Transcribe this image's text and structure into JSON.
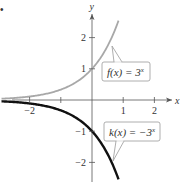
{
  "marker": "•",
  "chart_data": {
    "type": "line",
    "title": "",
    "xlabel": "x",
    "ylabel": "y",
    "xlim": [
      -2.9,
      2.6
    ],
    "ylim": [
      -2.6,
      2.8
    ],
    "x_ticks": [
      -2,
      -1,
      1,
      2
    ],
    "x_tick_labels": [
      "−2",
      "",
      "1",
      "2"
    ],
    "y_ticks": [
      -2,
      -1,
      1,
      2
    ],
    "y_tick_labels": [
      "−2",
      "−1",
      "1",
      "2"
    ],
    "grid": false,
    "series": [
      {
        "name": "f(x) = 3^x",
        "label_text": "f(x) = 3",
        "label_exp": "x",
        "color": "#a8a8a8",
        "x": [
          -2.9,
          -2.5,
          -2.0,
          -1.5,
          -1.0,
          -0.5,
          0.0,
          0.25,
          0.5,
          0.75,
          0.85
        ],
        "y": [
          0.041,
          0.064,
          0.111,
          0.192,
          0.333,
          0.577,
          1.0,
          1.316,
          1.732,
          2.28,
          2.544
        ]
      },
      {
        "name": "k(x) = -3^x",
        "label_text": "k(x) = −3",
        "label_exp": "x",
        "color": "#111111",
        "x": [
          -2.9,
          -2.5,
          -2.0,
          -1.5,
          -1.0,
          -0.5,
          0.0,
          0.25,
          0.5,
          0.75,
          0.85
        ],
        "y": [
          -0.041,
          -0.064,
          -0.111,
          -0.192,
          -0.333,
          -0.577,
          -1.0,
          -1.316,
          -1.732,
          -2.28,
          -2.544
        ]
      }
    ]
  }
}
